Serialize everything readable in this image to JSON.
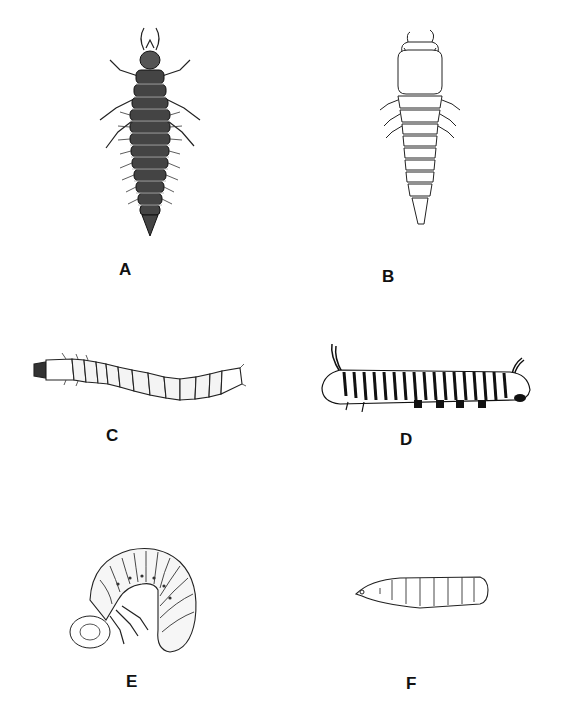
{
  "figure": {
    "panels": [
      {
        "id": "A",
        "label": "A",
        "subject": "campodeiform larva (dark, elongate, with legs and bristles)"
      },
      {
        "id": "B",
        "label": "B",
        "subject": "campodeiform larva (light outline, tapered abdomen)"
      },
      {
        "id": "C",
        "label": "C",
        "subject": "elateriform / wireworm larva (slender, segmented)"
      },
      {
        "id": "D",
        "label": "D",
        "subject": "eruciform larva (striped caterpillar with prolegs)"
      },
      {
        "id": "E",
        "label": "E",
        "subject": "scarabaeiform larva (C-shaped grub)"
      },
      {
        "id": "F",
        "label": "F",
        "subject": "vermiform larva (legless maggot)"
      }
    ]
  }
}
